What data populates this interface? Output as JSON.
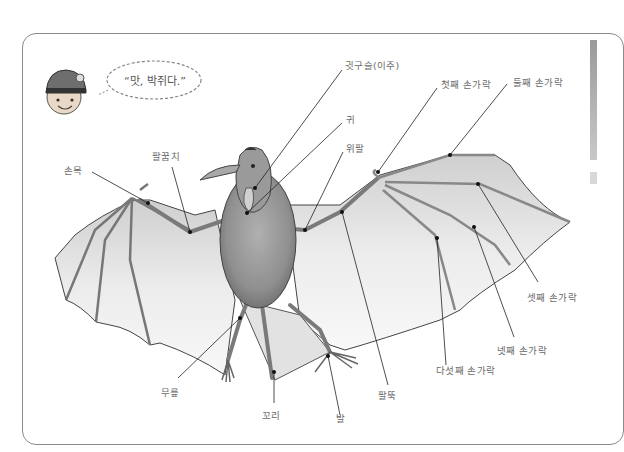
{
  "speech_bubble": {
    "text": "“맛, 박쥐다.”"
  },
  "labels": {
    "ear_tragus": "귓구슬(이주)",
    "first_finger": "첫째 손가락",
    "second_finger": "둘째 손가락",
    "ear": "귀",
    "upper_arm": "위팔",
    "elbow": "팔꿈치",
    "wrist": "손목",
    "third_finger": "셋째 손가락",
    "fourth_finger": "넷째 손가락",
    "fifth_finger": "다섯째 손가락",
    "forearm": "팔뚝",
    "knee": "무릎",
    "tail": "꼬리",
    "foot": "발"
  },
  "colors": {
    "line": "#222222",
    "label": "#6a6a6a",
    "frame": "#8a8a8a",
    "membrane": "#e6e6e6",
    "body": "#8c8c8c"
  }
}
